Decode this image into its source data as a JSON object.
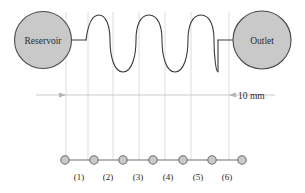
{
  "figure": {
    "type": "microfluidic-serpentine-channel-diagram",
    "width": 305,
    "height": 193,
    "background_color": "#ffffff"
  },
  "vessels": [
    {
      "id": "reservoir",
      "label": "Reservoir",
      "cx": 43,
      "cy": 40,
      "r": 28.5,
      "fill": "#c9c9c9",
      "stroke": "#4a4a4a"
    },
    {
      "id": "outlet",
      "label": "Outlet",
      "cx": 262,
      "cy": 40,
      "r": 29,
      "fill": "#c9c9c9",
      "stroke": "#4a4a4a"
    }
  ],
  "channel": {
    "stroke": "#3a3a3a",
    "stroke_width": 1.1,
    "inlet_segment": {
      "x1": 71,
      "y1": 40,
      "x2": 86,
      "y2": 40
    },
    "outlet_segment": {
      "x1": 218,
      "y1": 40,
      "x2": 233,
      "y2": 40
    },
    "wave": {
      "peaks": 5,
      "start_x": 86,
      "end_x": 218,
      "top_y": 15,
      "bottom_y": 72,
      "mid_y": 40
    }
  },
  "dimension": {
    "label": "10 mm",
    "label_x": 238,
    "label_y": 99,
    "line_y": 95,
    "line_x1": 36,
    "line_x2": 275,
    "arrow_left_x": 66,
    "arrow_right_x": 229,
    "color": "#c4c4c4"
  },
  "guide_lines": {
    "color": "#d8d8d8",
    "top_y": 12,
    "bottom_y": 160,
    "x_positions": [
      66,
      88,
      113,
      139,
      165,
      191,
      229
    ]
  },
  "node_chain": {
    "line_y": 160,
    "line_x1": 65,
    "line_x2": 242,
    "line_color": "#6e6e6e",
    "node_fill": "#c9c9c9",
    "node_stroke": "#6e6e6e",
    "node_radius": 4.2,
    "node_x_positions": [
      65,
      94,
      123,
      153,
      183,
      212,
      242
    ],
    "labels": [
      {
        "text": "(1)",
        "x": 79,
        "y": 180
      },
      {
        "text": "(2)",
        "x": 108,
        "y": 180
      },
      {
        "text": "(3)",
        "x": 138,
        "y": 180
      },
      {
        "text": "(4)",
        "x": 168,
        "y": 180
      },
      {
        "text": "(5)",
        "x": 198,
        "y": 180
      },
      {
        "text": "(6)",
        "x": 227,
        "y": 180
      }
    ]
  }
}
